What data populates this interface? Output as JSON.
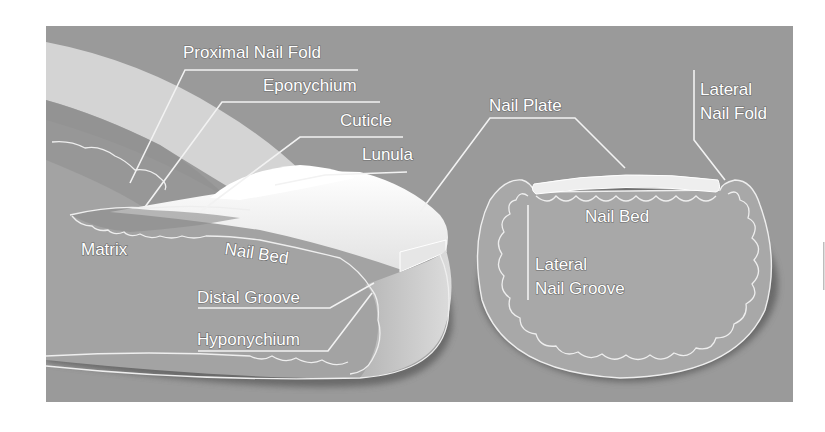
{
  "figure": {
    "colors": {
      "page_background": "#ffffff",
      "panel_background": "#9a9a9a",
      "proximal_fold": "#d2d2d2",
      "finger_body": "#a3a3a3",
      "nail_plate": "#f4f4f4",
      "lunula": "#ffffff",
      "cross_section": "#a8a8a8",
      "shadow": "#5e5e5e",
      "label_text": "#ffffff"
    }
  },
  "longitudinal_view": {
    "labels": {
      "proximal_nail_fold": "Proximal Nail Fold",
      "eponychium": "Eponychium",
      "cuticle": "Cuticle",
      "lunula": "Lunula",
      "matrix": "Matrix",
      "nail_bed": "Nail Bed",
      "distal_groove": "Distal Groove",
      "hyponychium": "Hyponychium"
    }
  },
  "cross_section_view": {
    "labels": {
      "nail_plate": "Nail Plate",
      "lateral_nail_fold_line1": "Lateral",
      "lateral_nail_fold_line2": "Nail Fold",
      "nail_bed": "Nail Bed",
      "lateral_nail_groove_line1": "Lateral",
      "lateral_nail_groove_line2": "Nail Groove"
    }
  }
}
